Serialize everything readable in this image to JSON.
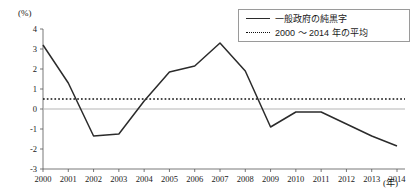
{
  "chart_data": {
    "type": "line",
    "title": "",
    "xlabel": "(年)",
    "ylabel": "(%)",
    "x": [
      2000,
      2001,
      2002,
      2003,
      2004,
      2005,
      2006,
      2007,
      2008,
      2009,
      2010,
      2011,
      2012,
      2013,
      2014
    ],
    "categories": [
      "2000",
      "2001",
      "2002",
      "2003",
      "2004",
      "2005",
      "2006",
      "2007",
      "2008",
      "2009",
      "2010",
      "2011",
      "2012",
      "2013",
      "2014"
    ],
    "xlim": [
      2000,
      2014
    ],
    "ylim": [
      -3,
      4
    ],
    "yticks": [
      -3,
      -2,
      -1,
      0,
      1,
      2,
      3,
      4
    ],
    "ytick_labels": [
      "-3",
      "-2",
      "-1",
      "0",
      "1",
      "2",
      "3",
      "4"
    ],
    "grid": false,
    "legend_position": "top-right",
    "series": [
      {
        "name": "一般政府の純黒字",
        "style": "solid",
        "color": "#2b2b2b",
        "values": [
          3.2,
          1.3,
          -1.35,
          -1.25,
          0.4,
          1.85,
          2.15,
          3.3,
          1.9,
          -0.9,
          -0.15,
          -0.15,
          -0.75,
          -1.35,
          -1.85
        ]
      },
      {
        "name": "2000 ～ 2014 年の平均",
        "style": "dotted",
        "color": "#111111",
        "constant_value": 0.5
      }
    ],
    "zero_line": 0
  },
  "legend": {
    "items": [
      {
        "label": "一般政府の純黒字",
        "style": "solid"
      },
      {
        "label": "2000 ～ 2014 年の平均",
        "style": "dotted"
      }
    ]
  },
  "axis": {
    "y_unit": "(%)",
    "x_unit": "(年)"
  }
}
